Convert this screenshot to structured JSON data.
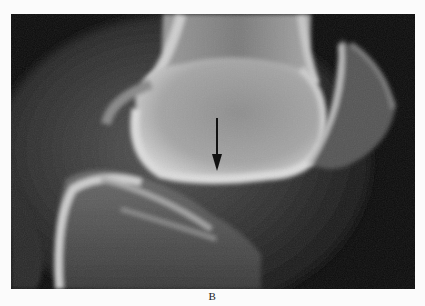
{
  "figure": {
    "label": "B",
    "annotations": [
      {
        "type": "arrow",
        "direction": "down",
        "color": "#111111"
      }
    ],
    "colors": {
      "background": "#0c0c0c",
      "bone_bright": "#d8d8d8",
      "bone_mid": "#8a8a8a",
      "soft_tissue": "#3a3a3a",
      "page": "#fbfbfb"
    }
  }
}
